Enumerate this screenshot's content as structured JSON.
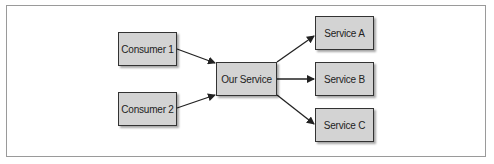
{
  "diagram": {
    "type": "flow",
    "nodes": [
      {
        "id": "consumer1",
        "label": "Consumer 1"
      },
      {
        "id": "consumer2",
        "label": "Consumer 2"
      },
      {
        "id": "our_service",
        "label": "Our Service"
      },
      {
        "id": "service_a",
        "label": "Service A"
      },
      {
        "id": "service_b",
        "label": "Service B"
      },
      {
        "id": "service_c",
        "label": "Service C"
      }
    ],
    "edges": [
      {
        "from": "consumer1",
        "to": "our_service"
      },
      {
        "from": "consumer2",
        "to": "our_service"
      },
      {
        "from": "our_service",
        "to": "service_a"
      },
      {
        "from": "our_service",
        "to": "service_b"
      },
      {
        "from": "our_service",
        "to": "service_c"
      }
    ],
    "colors": {
      "node_fill": "#d3d3d3",
      "node_border": "#333333",
      "edge": "#222222",
      "frame": "#9a9a9a"
    }
  }
}
